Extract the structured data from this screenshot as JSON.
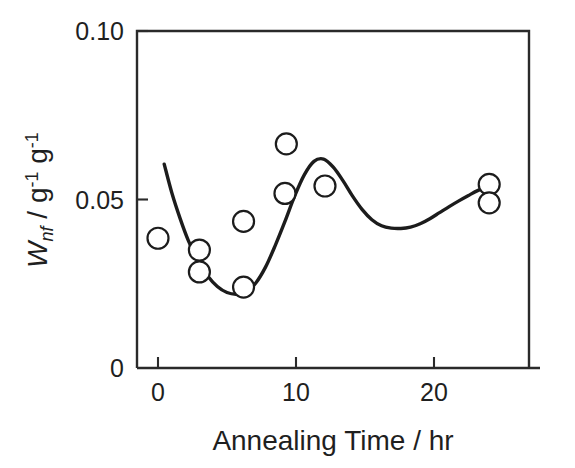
{
  "figure": {
    "background_color": "#ffffff",
    "line_color": "#1c1c1c",
    "marker_fill_color": "#ffffff",
    "text_color": "#1f1f1f"
  },
  "axes": {
    "x_title": "Annealing Time / hr",
    "y_title_main": "W",
    "y_title_subscript": "nf",
    "y_title_rest": " / g",
    "y_title_exp1": "-1",
    "y_title_mid": " g",
    "y_title_exp2": "-1",
    "x_tick_labels": [
      "0",
      "10",
      "20"
    ],
    "y_tick_labels": [
      "0",
      "0.05",
      "0.10"
    ]
  },
  "chart_data": {
    "type": "scatter",
    "title": "",
    "subtitle": "",
    "xlabel": "Annealing Time / hr",
    "ylabel": "Wnf / g-1 g-1",
    "xlim": [
      -1.1,
      26.9
    ],
    "ylim": [
      0,
      0.1
    ],
    "xticks": [
      0,
      10,
      20
    ],
    "yticks": [
      0,
      0.05,
      0.1
    ],
    "grid": false,
    "legend": null,
    "legend_position": "none",
    "series": [
      {
        "name": "W_nf measurements",
        "marker": "open-circle",
        "x": [
          0.0,
          3.0,
          3.0,
          6.2,
          6.2,
          9.3,
          9.2,
          12.1,
          24.0,
          24.0
        ],
        "y": [
          0.0385,
          0.035,
          0.0285,
          0.0435,
          0.024,
          0.0665,
          0.0518,
          0.054,
          0.0545,
          0.049
        ]
      },
      {
        "name": "fitted trend curve",
        "marker": "none",
        "style": "solid-line",
        "x": [
          0.45,
          1.0,
          1.6,
          2.2,
          2.9,
          3.6,
          4.3,
          5.0,
          5.7,
          6.4,
          7.1,
          7.8,
          8.5,
          9.2,
          9.9,
          10.6,
          11.3,
          12.0,
          12.7,
          13.4,
          14.1,
          14.8,
          15.5,
          16.2,
          16.9,
          17.6,
          18.3,
          19.0,
          19.7,
          20.4,
          21.1,
          21.8,
          22.5,
          23.2,
          23.9,
          24.6
        ],
        "y": [
          0.0605,
          0.052,
          0.0444,
          0.0378,
          0.0318,
          0.0273,
          0.0242,
          0.0224,
          0.0219,
          0.0226,
          0.0253,
          0.03,
          0.0364,
          0.0435,
          0.051,
          0.0573,
          0.0613,
          0.062,
          0.0596,
          0.0556,
          0.051,
          0.047,
          0.044,
          0.0422,
          0.0415,
          0.0414,
          0.0418,
          0.0428,
          0.0443,
          0.0461,
          0.0479,
          0.0496,
          0.0512,
          0.0527,
          0.0538,
          0.0544
        ]
      }
    ]
  },
  "geometry": {
    "plot_left_px": 137,
    "plot_right_px": 529,
    "plot_top_px": 31,
    "plot_bottom_px": 368,
    "x0_px": 158,
    "x_per_unit_px": 13.8,
    "y0_px": 368,
    "y_per_unit_px": 3370
  }
}
